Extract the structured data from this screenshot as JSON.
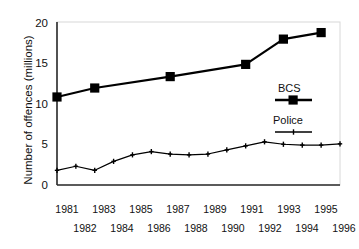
{
  "chart_data": {
    "type": "line",
    "title": "",
    "xlabel": "",
    "ylabel": "Number of offences (millions)",
    "ylim": [
      0,
      20
    ],
    "yticks": [
      0,
      5,
      10,
      15,
      20
    ],
    "ytick_labels": [
      "0",
      "5",
      "10",
      "15",
      "20"
    ],
    "xlim": [
      1981,
      1996
    ],
    "x": [
      1981,
      1982,
      1983,
      1984,
      1985,
      1986,
      1987,
      1988,
      1989,
      1990,
      1991,
      1992,
      1993,
      1994,
      1995,
      1996
    ],
    "xtick_labels_top": [
      "1981",
      "1983",
      "1985",
      "1987",
      "1989",
      "1991",
      "1993",
      "1995"
    ],
    "xtick_labels_bottom": [
      "1982",
      "1984",
      "1986",
      "1988",
      "1990",
      "1992",
      "1994",
      "1996"
    ],
    "grid": false,
    "legend_position": "inside-right",
    "series": [
      {
        "name": "BCS",
        "marker": "square",
        "line_width": 2.2,
        "color": "#000000",
        "x": [
          1981,
          1983,
          1987,
          1991,
          1993,
          1995
        ],
        "values": [
          10.8,
          11.9,
          13.3,
          14.8,
          17.9,
          18.7
        ]
      },
      {
        "name": "Police",
        "marker": "plus",
        "line_width": 1.2,
        "color": "#000000",
        "x": [
          1981,
          1982,
          1983,
          1984,
          1985,
          1986,
          1987,
          1988,
          1989,
          1990,
          1991,
          1992,
          1993,
          1994,
          1995,
          1996
        ],
        "values": [
          1.8,
          2.3,
          1.8,
          2.9,
          3.7,
          4.1,
          3.8,
          3.7,
          3.8,
          4.3,
          4.8,
          5.3,
          5.0,
          4.9,
          4.9,
          5.05
        ]
      }
    ],
    "legend": [
      {
        "label": "BCS",
        "marker": "square-thick-line"
      },
      {
        "label": "Police",
        "marker": "plus-thin-line"
      }
    ]
  }
}
